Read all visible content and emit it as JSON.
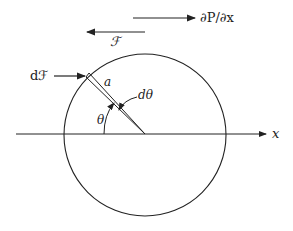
{
  "diagram": {
    "labels": {
      "pressure_gradient": "∂P/∂x",
      "total_force": "ℱ",
      "force_element": "dℱ",
      "radius": "a",
      "angle_increment": "dθ",
      "angle": "θ",
      "axis": "x"
    },
    "colors": {
      "stroke": "#222222",
      "background": "#ffffff"
    }
  }
}
